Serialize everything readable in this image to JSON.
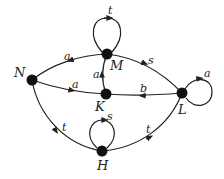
{
  "diagram": {
    "type": "directed-graph",
    "nodes": [
      {
        "id": "N",
        "label": "N"
      },
      {
        "id": "M",
        "label": "M"
      },
      {
        "id": "K",
        "label": "K"
      },
      {
        "id": "L",
        "label": "L"
      },
      {
        "id": "H",
        "label": "H"
      }
    ],
    "edges": [
      {
        "from": "M",
        "to": "M",
        "label": "t"
      },
      {
        "from": "M",
        "to": "N",
        "label": "a"
      },
      {
        "from": "M",
        "to": "L",
        "label": "s"
      },
      {
        "from": "K",
        "to": "M",
        "label": "a"
      },
      {
        "from": "N",
        "to": "K",
        "label": "a"
      },
      {
        "from": "L",
        "to": "K",
        "label": "b"
      },
      {
        "from": "L",
        "to": "L",
        "label": "a"
      },
      {
        "from": "N",
        "to": "H",
        "label": "t"
      },
      {
        "from": "H",
        "to": "H",
        "label": "s"
      },
      {
        "from": "H",
        "to": "L",
        "label": "t"
      }
    ]
  },
  "labels": {
    "N": "N",
    "M": "M",
    "K": "K",
    "L": "L",
    "H": "H",
    "e_MM": "t",
    "e_MN": "a",
    "e_ML": "s",
    "e_KM": "a",
    "e_NK": "a",
    "e_LK": "b",
    "e_LL": "a",
    "e_NH": "t",
    "e_HH": "s",
    "e_HL": "t"
  }
}
